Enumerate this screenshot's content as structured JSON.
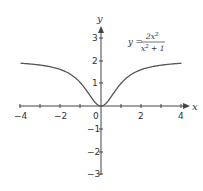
{
  "chart_data": {
    "type": "line",
    "title": "",
    "equation": {
      "lhs": "y",
      "equals": "=",
      "numerator": "2x²",
      "denominator": "x² + 1"
    },
    "xlabel": "x",
    "ylabel": "y",
    "xlim": [
      -4,
      4
    ],
    "ylim": [
      -3,
      3
    ],
    "grid": false,
    "legend": null,
    "x_ticks": [
      -4,
      -3,
      -2,
      -1,
      0,
      1,
      2,
      3,
      4
    ],
    "x_tick_labels": [
      "-4",
      "-2",
      "0",
      "2",
      "4"
    ],
    "y_tick_labels": [
      "3",
      "2",
      "1",
      "-1",
      "-2",
      "-3"
    ],
    "series": [
      {
        "name": "y = 2x^2/(x^2+1)",
        "x": [
          -4,
          -3,
          -2,
          -1.5,
          -1,
          -0.5,
          0,
          0.5,
          1,
          1.5,
          2,
          3,
          4
        ],
        "y": [
          1.88,
          1.8,
          1.6,
          1.38,
          1.0,
          0.4,
          0,
          0.4,
          1.0,
          1.38,
          1.6,
          1.8,
          1.88
        ]
      }
    ],
    "colors": {
      "curve": "#555555",
      "axes": "#444444"
    }
  },
  "labels": {
    "x_axis": "x",
    "y_axis": "y",
    "xt_m4": "−4",
    "xt_m2": "−2",
    "xt_0": "0",
    "xt_2": "2",
    "xt_4": "4",
    "yt_3": "3",
    "yt_2": "2",
    "yt_1": "1",
    "yt_m1": "−1",
    "yt_m2": "−2",
    "yt_m3": "−3",
    "eq_lhs": "y =",
    "eq_num": "2x",
    "eq_num_exp": "2",
    "eq_den": "x",
    "eq_den_exp": "2",
    "eq_den_rest": " + 1"
  }
}
